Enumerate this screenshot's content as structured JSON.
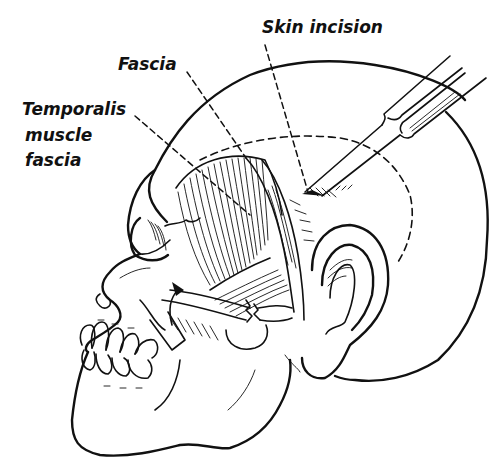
{
  "figure": {
    "colors": {
      "ink": "#111111",
      "background": "#ffffff"
    },
    "labels": [
      {
        "id": "skin-incision",
        "text": "Skin incision",
        "x": 262,
        "y": 33
      },
      {
        "id": "fascia",
        "text": "Fascia",
        "x": 118,
        "y": 70
      },
      {
        "id": "temporalis-1",
        "text": "Temporalis",
        "x": 22,
        "y": 115
      },
      {
        "id": "temporalis-2",
        "text": "muscle",
        "x": 25,
        "y": 141
      },
      {
        "id": "temporalis-3",
        "text": "fascia",
        "x": 25,
        "y": 166
      }
    ],
    "structures": [
      "head-outline",
      "skull",
      "orbit",
      "nasal-bone",
      "teeth",
      "mandible",
      "temporalis-muscle",
      "fascia-flap",
      "zygomatic-arch",
      "ear",
      "retractor-instrument",
      "dashed-incision-line",
      "rotation-arrow"
    ]
  }
}
